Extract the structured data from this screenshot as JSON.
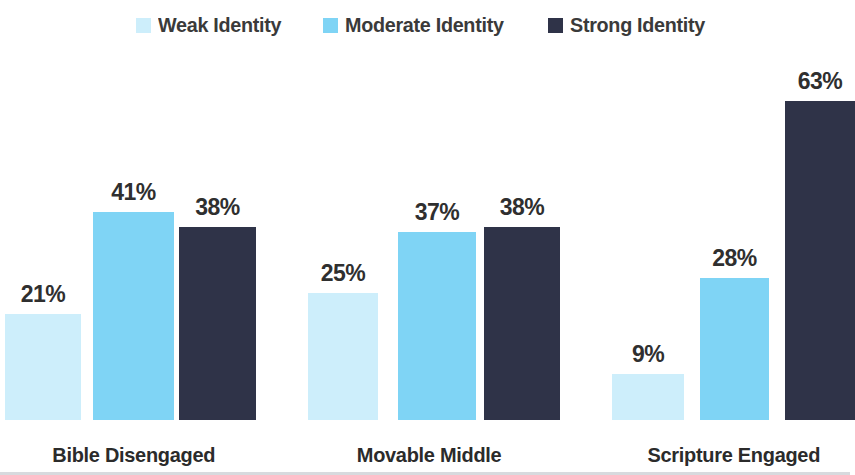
{
  "chart_data": {
    "type": "bar",
    "title": "",
    "subtitle": "",
    "xlabel": "",
    "ylabel": "",
    "ylim": [
      0,
      70
    ],
    "grid": false,
    "legend_position": "top-center",
    "value_suffix": "%",
    "categories": [
      "Bible Disengaged",
      "Movable Middle",
      "Scripture Engaged"
    ],
    "series": [
      {
        "name": "Weak Identity",
        "color": "#cdeefb",
        "values": [
          21,
          25,
          9
        ],
        "labels": [
          "21%",
          "25%",
          "9%"
        ]
      },
      {
        "name": "Moderate Identity",
        "color": "#7fd4f5",
        "values": [
          41,
          37,
          28
        ],
        "labels": [
          "41%",
          "37%",
          "28%"
        ]
      },
      {
        "name": "Strong Identity",
        "color": "#2f3348",
        "values": [
          38,
          38,
          63
        ],
        "labels": [
          "38%",
          "38%",
          "63%"
        ]
      }
    ]
  },
  "legend": {
    "items": [
      {
        "label": "Weak Identity",
        "color": "#cdeefb"
      },
      {
        "label": "Moderate Identity",
        "color": "#7fd4f5"
      },
      {
        "label": "Strong Identity",
        "color": "#2f3348"
      }
    ]
  },
  "axis": {
    "baseline_color": "#d8dade"
  },
  "categories": [
    {
      "label": "Bible Disengaged"
    },
    {
      "label": "Movable Middle"
    },
    {
      "label": "Scripture Engaged"
    }
  ],
  "bars": [
    {
      "group": "Bible Disengaged",
      "series": "Weak Identity",
      "label": "21%"
    },
    {
      "group": "Bible Disengaged",
      "series": "Moderate Identity",
      "label": "41%"
    },
    {
      "group": "Bible Disengaged",
      "series": "Strong Identity",
      "label": "38%"
    },
    {
      "group": "Movable Middle",
      "series": "Weak Identity",
      "label": "25%"
    },
    {
      "group": "Movable Middle",
      "series": "Moderate Identity",
      "label": "37%"
    },
    {
      "group": "Movable Middle",
      "series": "Strong Identity",
      "label": "38%"
    },
    {
      "group": "Scripture Engaged",
      "series": "Weak Identity",
      "label": "9%"
    },
    {
      "group": "Scripture Engaged",
      "series": "Moderate Identity",
      "label": "28%"
    },
    {
      "group": "Scripture Engaged",
      "series": "Strong Identity",
      "label": "63%"
    }
  ]
}
